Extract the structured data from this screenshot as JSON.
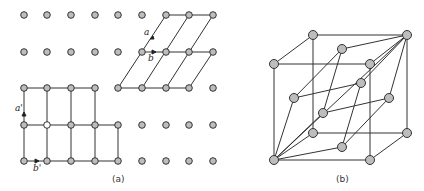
{
  "figure_a": {
    "caption": "(a)",
    "labels": {
      "a": "a",
      "b": "b",
      "a_prime": "a'",
      "b_prime": "b'"
    },
    "lattice": {
      "columns_x": [
        24,
        47,
        71,
        95,
        118,
        142,
        166,
        189,
        213
      ],
      "rows_y": [
        15,
        52,
        88,
        125,
        161
      ]
    }
  },
  "figure_b": {
    "caption": "(b)"
  },
  "colors": {
    "node_fill": "#bdbdbd",
    "stroke": "#333333"
  }
}
